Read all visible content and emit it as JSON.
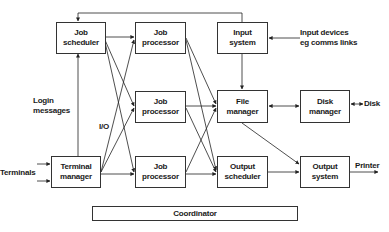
{
  "diagram": {
    "nodes": {
      "job_scheduler": "Job\nscheduler",
      "job_processor_1": "Job\nprocessor",
      "job_processor_2": "Job\nprocessor",
      "job_processor_3": "Job\nprocessor",
      "input_system": "Input\nsystem",
      "file_manager": "File\nmanager",
      "output_scheduler": "Output\nscheduler",
      "disk_manager": "Disk\nmanager",
      "output_system": "Output\nsystem",
      "terminal_manager": "Terminal\nmanager",
      "coordinator": "Coordinator"
    },
    "labels": {
      "input_devices": "Input devices\neg comms links",
      "login_messages": "Login\nmessages",
      "io": "I/O",
      "terminals": "Terminals",
      "disk": "Disk",
      "printer": "Printer"
    },
    "edges": [
      {
        "from": "input_system",
        "to": "job_scheduler",
        "note": "top loop line"
      },
      {
        "from": "job_scheduler",
        "to": "job_processor_1"
      },
      {
        "from": "job_scheduler",
        "to": "job_processor_2"
      },
      {
        "from": "job_scheduler",
        "to": "job_processor_3"
      },
      {
        "from": "terminal_manager",
        "to": "job_scheduler",
        "label": "Login messages"
      },
      {
        "from": "terminal_manager",
        "to": "job_processor_1",
        "label": "I/O"
      },
      {
        "from": "terminal_manager",
        "to": "job_processor_2"
      },
      {
        "from": "terminal_manager",
        "to": "job_processor_3"
      },
      {
        "from": "job_processor_1",
        "to": "file_manager"
      },
      {
        "from": "job_processor_1",
        "to": "output_scheduler"
      },
      {
        "from": "job_processor_2",
        "to": "file_manager"
      },
      {
        "from": "job_processor_2",
        "to": "output_scheduler"
      },
      {
        "from": "job_processor_3",
        "to": "file_manager"
      },
      {
        "from": "job_processor_3",
        "to": "output_scheduler"
      },
      {
        "from": "input_devices",
        "to": "input_system"
      },
      {
        "from": "input_system",
        "to": "file_manager"
      },
      {
        "from": "file_manager",
        "to": "disk_manager",
        "bidirectional": true
      },
      {
        "from": "disk_manager",
        "to": "disk",
        "bidirectional": true
      },
      {
        "from": "file_manager",
        "to": "output_system"
      },
      {
        "from": "output_scheduler",
        "to": "output_system"
      },
      {
        "from": "output_system",
        "to": "printer"
      },
      {
        "from": "terminals",
        "to": "terminal_manager"
      }
    ]
  }
}
